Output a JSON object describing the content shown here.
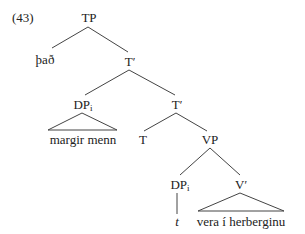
{
  "example_number": "(43)",
  "tree": {
    "root": "TP",
    "nodes": {
      "tp": {
        "label": "TP"
      },
      "spec_tp": {
        "label": "það"
      },
      "tbar1": {
        "label": "T",
        "prime": "′"
      },
      "dp1": {
        "label": "DP",
        "sub": "i"
      },
      "dp1_yield": {
        "label": "margir menn"
      },
      "tbar2": {
        "label": "T",
        "prime": "′"
      },
      "t_head": {
        "label": "T"
      },
      "vp": {
        "label": "VP"
      },
      "dp2": {
        "label": "DP",
        "sub": "i"
      },
      "trace": {
        "label": "t"
      },
      "vbar": {
        "label": "V",
        "prime": "′"
      },
      "vbar_yield": {
        "label": "vera í herberginu"
      }
    }
  }
}
